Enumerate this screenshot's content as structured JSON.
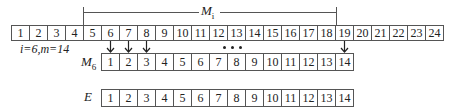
{
  "bracket": {
    "label": "M",
    "subscript": "i"
  },
  "top_row": {
    "cells": [
      "1",
      "2",
      "3",
      "4",
      "5",
      "6",
      "7",
      "8",
      "9",
      "10",
      "11",
      "12",
      "13",
      "14",
      "15",
      "16",
      "17",
      "18",
      "19",
      "20",
      "21",
      "22",
      "23",
      "24"
    ]
  },
  "params_label": "i=6,m=14",
  "m6_row": {
    "label": "M",
    "subscript": "6",
    "cells": [
      "1",
      "2",
      "3",
      "4",
      "5",
      "6",
      "7",
      "8",
      "9",
      "10",
      "11",
      "12",
      "13",
      "14"
    ]
  },
  "e_row": {
    "label": "E",
    "cells": [
      "1",
      "2",
      "3",
      "4",
      "5",
      "6",
      "7",
      "8",
      "9",
      "10",
      "11",
      "12",
      "13",
      "14"
    ]
  },
  "arrows": {
    "from_cells": [
      "6",
      "7",
      "8",
      "19"
    ],
    "to_cells": [
      "1",
      "2",
      "3",
      "14"
    ]
  },
  "ellipsis": "..."
}
